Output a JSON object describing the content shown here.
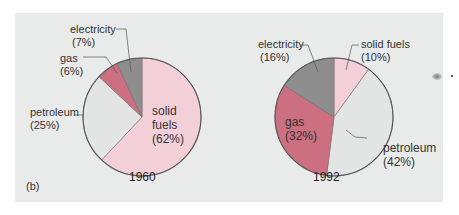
{
  "panel_label": "(b)",
  "colors": {
    "background": "#e9ebeb",
    "solid_fuels": "#f3d0d8",
    "gas": "#cc6f80",
    "electricity": "#8e8e8e",
    "petroleum": "#e3e4e4",
    "outline": "#555555"
  },
  "pies": [
    {
      "year": "1960",
      "labels": [
        {
          "name": "electricity",
          "pct": "(7%)"
        },
        {
          "name": "gas",
          "pct": "(6%)"
        },
        {
          "name": "petroleum",
          "pct": "(25%)"
        },
        {
          "name1": "solid",
          "name2": "fuels",
          "pct": "(62%)"
        }
      ]
    },
    {
      "year": "1992",
      "labels": [
        {
          "name": "electricity",
          "pct": "(16%)"
        },
        {
          "name": "solid fuels",
          "pct": "(10%)"
        },
        {
          "name": "gas",
          "pct": "(32%)"
        },
        {
          "name": "petroleum",
          "pct": "(42%)"
        }
      ]
    }
  ],
  "chart_data": [
    {
      "type": "pie",
      "title": "1960",
      "categories": [
        "solid fuels",
        "petroleum",
        "gas",
        "electricity"
      ],
      "values": [
        62,
        25,
        6,
        7
      ],
      "unit": "%",
      "legend": "inline labels with leader lines"
    },
    {
      "type": "pie",
      "title": "1992",
      "categories": [
        "solid fuels",
        "petroleum",
        "gas",
        "electricity"
      ],
      "values": [
        10,
        42,
        32,
        16
      ],
      "unit": "%",
      "legend": "inline labels with leader lines"
    }
  ]
}
